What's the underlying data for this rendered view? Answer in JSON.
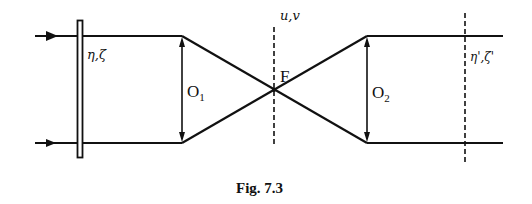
{
  "figure": {
    "caption": "Fig. 7.3",
    "labels": {
      "input_plane": "η,ζ",
      "fourier_plane": "u,v",
      "focus": "F",
      "lens1_main": "O",
      "lens1_sub": "1",
      "lens2_main": "O",
      "lens2_sub": "2",
      "output_plane": "η',ζ'"
    },
    "colors": {
      "stroke": "#111111",
      "background": "#ffffff"
    }
  }
}
